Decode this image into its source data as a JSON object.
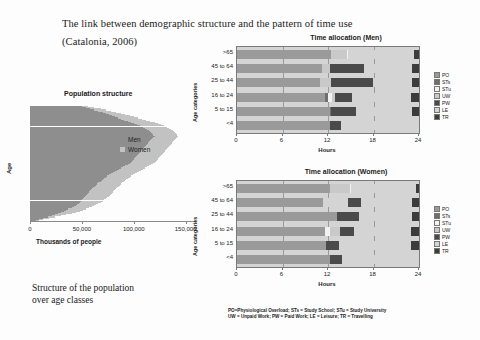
{
  "slide": {
    "title_line1": "The link between demographic structure and the pattern of time use",
    "title_line2": "(Catalonia, 2006)",
    "caption_line1": "Structure of the population",
    "caption_line2": "over age classes",
    "footnote_line1": "PO=Physiological Overload; STs = Study School; STu = Study University",
    "footnote_line2": "UW = Unpaid Work; PW = Paid Work; LE = Leisure; TR = Travelling"
  },
  "colors": {
    "PO": "#9a9a9a",
    "STs": "#6f6f6f",
    "STu": "#f2f2f2",
    "UW": "#c9c9c9",
    "PW": "#4a4a4a",
    "LE": "#d4d4d4",
    "TR": "#3c3c3c",
    "men": "#8e8e8e",
    "women": "#c2c2c2",
    "plot_background": "#d4d4d4",
    "axis": "#7a7a7a"
  },
  "chart_data": [
    {
      "type": "bar",
      "id": "population-pyramid",
      "title": "Population structure",
      "xlabel": "Thousands of people",
      "ylabel": "Age",
      "xlim": [
        0,
        160000
      ],
      "xticks": [
        0,
        50000,
        100000,
        150000
      ],
      "xtick_labels": [
        "0",
        "50,000",
        "100,000",
        "150,000"
      ],
      "grid": false,
      "legend_position": "right",
      "series": [
        {
          "name": "Men",
          "color": "#8e8e8e",
          "values": [
            6000,
            9000,
            13000,
            17000,
            21000,
            24000,
            27000,
            30000,
            33000,
            35000,
            37000,
            40000,
            42000,
            44000,
            45000,
            47000,
            48000,
            49000,
            50000,
            51000,
            52000,
            53000,
            54000,
            55000,
            56000,
            57000,
            58000,
            59000,
            60000,
            61000,
            63000,
            64000,
            65000,
            66000,
            68000,
            69000,
            70000,
            71000,
            73000,
            74000,
            76000,
            78000,
            80000,
            82000,
            84000,
            86000,
            88000,
            90000,
            92000,
            94000,
            96000,
            97000,
            98000,
            99000,
            100000,
            101000,
            102000,
            103000,
            104000,
            105000,
            106000,
            107000,
            108000,
            109000,
            110000,
            111000,
            112000,
            113000,
            114000,
            115000,
            116000,
            117000,
            118000,
            119000,
            120000,
            119000,
            118000,
            117000,
            116000,
            115000,
            113000,
            111000,
            109000,
            106000,
            103000,
            100000,
            97000,
            94000,
            91000,
            88000,
            85000,
            82000,
            79000,
            76000,
            73000,
            70000,
            66000,
            62000,
            58000,
            54000,
            50000
          ]
        },
        {
          "name": "Women",
          "color": "#c2c2c2",
          "values": [
            9000,
            13000,
            18000,
            24000,
            30000,
            35000,
            40000,
            44000,
            48000,
            51000,
            54000,
            57000,
            60000,
            62000,
            64000,
            66000,
            68000,
            70000,
            71000,
            73000,
            74000,
            76000,
            77000,
            78000,
            79000,
            80000,
            81000,
            82000,
            83000,
            84000,
            86000,
            87000,
            88000,
            89000,
            91000,
            92000,
            93000,
            94000,
            96000,
            97000,
            99000,
            101000,
            103000,
            105000,
            107000,
            109000,
            111000,
            113000,
            115000,
            117000,
            119000,
            120000,
            121000,
            122000,
            123000,
            124000,
            125000,
            126000,
            127000,
            128000,
            129000,
            130000,
            131000,
            132000,
            133000,
            134000,
            135000,
            136000,
            137000,
            138000,
            139000,
            140000,
            141000,
            142000,
            143000,
            142000,
            141000,
            140000,
            139000,
            138000,
            136000,
            134000,
            132000,
            129000,
            126000,
            123000,
            120000,
            116000,
            112000,
            108000,
            104000,
            100000,
            96000,
            92000,
            88000,
            83000,
            78000,
            73000,
            68000,
            62000,
            56000
          ]
        }
      ],
      "legend": [
        "Men",
        "Women"
      ]
    },
    {
      "type": "bar",
      "id": "time-allocation-men",
      "title": "Time allocation (Men)",
      "xlabel": "Hours",
      "ylabel": "Age categories",
      "xlim": [
        0,
        24
      ],
      "xticks": [
        0,
        6,
        12,
        18,
        24
      ],
      "xtick_labels": [
        "0",
        "6",
        "12",
        "18",
        "24"
      ],
      "stacked": true,
      "grid": true,
      "legend_position": "right",
      "categories": [
        "<4",
        "5 to 15",
        "16 to 24",
        "25 to 44",
        "45 to 64",
        ">65"
      ],
      "legend": [
        "PO",
        "STs",
        "STu",
        "UW",
        "PW",
        "LE",
        "TR"
      ],
      "rows": [
        {
          "category": "<4",
          "segments": [
            {
              "key": "PO",
              "start": 0,
              "width": 12.2
            },
            {
              "key": "LE",
              "start": 12.2,
              "width": 0.1
            },
            {
              "key": "PW",
              "start": 12.3,
              "width": 1.4
            },
            {
              "key": "LE",
              "start": 13.7,
              "width": 10.3
            }
          ]
        },
        {
          "category": "5 to 15",
          "segments": [
            {
              "key": "PO",
              "start": 0,
              "width": 12.2
            },
            {
              "key": "STs",
              "start": 12.2,
              "width": 0.2
            },
            {
              "key": "PW",
              "start": 12.4,
              "width": 3.3
            },
            {
              "key": "LE",
              "start": 15.7,
              "width": 7.4
            },
            {
              "key": "TR",
              "start": 23.1,
              "width": 0.9
            }
          ]
        },
        {
          "category": "16 to 24",
          "segments": [
            {
              "key": "PO",
              "start": 0,
              "width": 11.6
            },
            {
              "key": "STs",
              "start": 11.6,
              "width": 0.45
            },
            {
              "key": "STu",
              "start": 12.05,
              "width": 0.45
            },
            {
              "key": "UW",
              "start": 12.5,
              "width": 0.4
            },
            {
              "key": "PW",
              "start": 12.9,
              "width": 2.2
            },
            {
              "key": "LE",
              "start": 15.1,
              "width": 7.9
            },
            {
              "key": "TR",
              "start": 23.0,
              "width": 1.0
            }
          ]
        },
        {
          "category": "25 to 44",
          "segments": [
            {
              "key": "PO",
              "start": 0,
              "width": 11.0
            },
            {
              "key": "UW",
              "start": 11.0,
              "width": 1.4
            },
            {
              "key": "PW",
              "start": 12.4,
              "width": 5.6
            },
            {
              "key": "LE",
              "start": 18.0,
              "width": 5.1
            },
            {
              "key": "TR",
              "start": 23.1,
              "width": 0.9
            }
          ]
        },
        {
          "category": "45 to 64",
          "segments": [
            {
              "key": "PO",
              "start": 0,
              "width": 11.2
            },
            {
              "key": "UW",
              "start": 11.2,
              "width": 1.1
            },
            {
              "key": "PW",
              "start": 12.3,
              "width": 4.5
            },
            {
              "key": "LE",
              "start": 16.8,
              "width": 6.3
            },
            {
              "key": "TR",
              "start": 23.1,
              "width": 0.9
            }
          ]
        },
        {
          "category": ">65",
          "segments": [
            {
              "key": "PO",
              "start": 0,
              "width": 12.4
            },
            {
              "key": "UW",
              "start": 12.4,
              "width": 2.1
            },
            {
              "key": "STu",
              "start": 14.5,
              "width": 0.2
            },
            {
              "key": "LE",
              "start": 14.7,
              "width": 8.6
            },
            {
              "key": "TR",
              "start": 23.3,
              "width": 0.7
            }
          ]
        }
      ]
    },
    {
      "type": "bar",
      "id": "time-allocation-women",
      "title": "Time allocation (Women)",
      "xlabel": "Hours",
      "ylabel": "Age categories",
      "xlim": [
        0,
        24
      ],
      "xticks": [
        0,
        6,
        12,
        18,
        24
      ],
      "xtick_labels": [
        "0",
        "6",
        "12",
        "18",
        "24"
      ],
      "stacked": true,
      "grid": true,
      "legend_position": "right",
      "categories": [
        "<4",
        "5 to 15",
        "16 to 24",
        "25 to 44",
        "45 to 64",
        ">65"
      ],
      "legend": [
        "PO",
        "STs",
        "STu",
        "UW",
        "PW",
        "LE",
        "TR"
      ],
      "rows": [
        {
          "category": "<4",
          "segments": [
            {
              "key": "PO",
              "start": 0,
              "width": 12.3
            },
            {
              "key": "PW",
              "start": 12.3,
              "width": 1.5
            },
            {
              "key": "LE",
              "start": 13.8,
              "width": 10.2
            }
          ]
        },
        {
          "category": "5 to 15",
          "segments": [
            {
              "key": "PO",
              "start": 0,
              "width": 11.8
            },
            {
              "key": "PW",
              "start": 11.8,
              "width": 1.6
            },
            {
              "key": "LE",
              "start": 13.4,
              "width": 9.6
            },
            {
              "key": "TR",
              "start": 23.0,
              "width": 1.0
            }
          ]
        },
        {
          "category": "16 to 24",
          "segments": [
            {
              "key": "PO",
              "start": 0,
              "width": 11.6
            },
            {
              "key": "STu",
              "start": 11.6,
              "width": 0.6
            },
            {
              "key": "UW",
              "start": 12.2,
              "width": 1.4
            },
            {
              "key": "PW",
              "start": 13.6,
              "width": 1.8
            },
            {
              "key": "LE",
              "start": 15.4,
              "width": 7.6
            },
            {
              "key": "TR",
              "start": 23.0,
              "width": 1.0
            }
          ]
        },
        {
          "category": "25 to 44",
          "segments": [
            {
              "key": "PO",
              "start": 0,
              "width": 13.2
            },
            {
              "key": "PW",
              "start": 13.2,
              "width": 2.9
            },
            {
              "key": "LE",
              "start": 16.1,
              "width": 7.0
            },
            {
              "key": "TR",
              "start": 23.1,
              "width": 0.9
            }
          ]
        },
        {
          "category": "45 to 64",
          "segments": [
            {
              "key": "PO",
              "start": 0,
              "width": 11.3
            },
            {
              "key": "LE",
              "start": 11.3,
              "width": 3.3
            },
            {
              "key": "PW",
              "start": 14.6,
              "width": 1.7
            },
            {
              "key": "LE",
              "start": 16.3,
              "width": 6.8
            },
            {
              "key": "TR",
              "start": 23.1,
              "width": 0.9
            }
          ]
        },
        {
          "category": ">65",
          "segments": [
            {
              "key": "PO",
              "start": 0,
              "width": 12.3
            },
            {
              "key": "UW",
              "start": 12.3,
              "width": 2.6
            },
            {
              "key": "STu",
              "start": 14.9,
              "width": 0.15
            },
            {
              "key": "LE",
              "start": 15.05,
              "width": 8.55
            },
            {
              "key": "TR",
              "start": 23.6,
              "width": 0.4
            }
          ]
        }
      ]
    }
  ]
}
